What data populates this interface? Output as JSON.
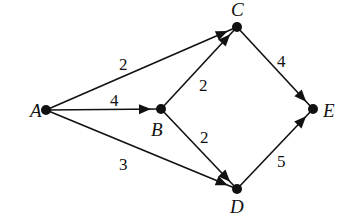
{
  "graph": {
    "type": "directed-weighted",
    "nodes": [
      {
        "id": "A",
        "label": "A",
        "x": 46,
        "y": 110,
        "lx": 30,
        "ly": 117
      },
      {
        "id": "B",
        "label": "B",
        "x": 161,
        "y": 109,
        "lx": 151,
        "ly": 136
      },
      {
        "id": "C",
        "label": "C",
        "x": 237,
        "y": 27,
        "lx": 231,
        "ly": 16
      },
      {
        "id": "D",
        "label": "D",
        "x": 237,
        "y": 189,
        "lx": 230,
        "ly": 213
      },
      {
        "id": "E",
        "label": "E",
        "x": 313,
        "y": 109,
        "lx": 323,
        "ly": 117
      }
    ],
    "edges": [
      {
        "from": "A",
        "to": "C",
        "weight": "2",
        "lx": 119,
        "ly": 70
      },
      {
        "from": "A",
        "to": "B",
        "weight": "4",
        "lx": 110,
        "ly": 106
      },
      {
        "from": "A",
        "to": "D",
        "weight": "3",
        "lx": 119,
        "ly": 170
      },
      {
        "from": "B",
        "to": "C",
        "weight": "2",
        "lx": 199,
        "ly": 91
      },
      {
        "from": "B",
        "to": "D",
        "weight": "2",
        "lx": 200,
        "ly": 143
      },
      {
        "from": "C",
        "to": "E",
        "weight": "4",
        "lx": 277,
        "ly": 67
      },
      {
        "from": "D",
        "to": "E",
        "weight": "5",
        "lx": 277,
        "ly": 167
      }
    ]
  }
}
